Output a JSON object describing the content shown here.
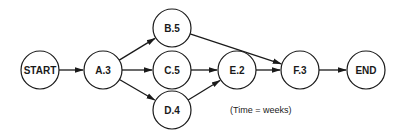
{
  "diagram": {
    "type": "activity-network",
    "nodes": [
      {
        "id": "START",
        "label": "START"
      },
      {
        "id": "A",
        "label": "A.3",
        "activity": "A",
        "duration": 3
      },
      {
        "id": "B",
        "label": "B.5",
        "activity": "B",
        "duration": 5
      },
      {
        "id": "C",
        "label": "C.5",
        "activity": "C",
        "duration": 5
      },
      {
        "id": "D",
        "label": "D.4",
        "activity": "D",
        "duration": 4
      },
      {
        "id": "E",
        "label": "E.2",
        "activity": "E",
        "duration": 2
      },
      {
        "id": "F",
        "label": "F.3",
        "activity": "F",
        "duration": 3
      },
      {
        "id": "END",
        "label": "END"
      }
    ],
    "edges": [
      {
        "from": "START",
        "to": "A"
      },
      {
        "from": "A",
        "to": "B"
      },
      {
        "from": "A",
        "to": "C"
      },
      {
        "from": "A",
        "to": "D"
      },
      {
        "from": "B",
        "to": "F"
      },
      {
        "from": "C",
        "to": "E"
      },
      {
        "from": "D",
        "to": "E"
      },
      {
        "from": "E",
        "to": "F"
      },
      {
        "from": "F",
        "to": "END"
      }
    ],
    "note": "(Time = weeks)"
  }
}
